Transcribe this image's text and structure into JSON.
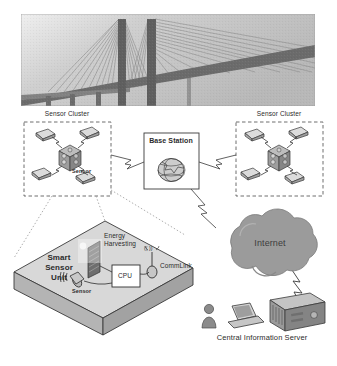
{
  "figure": {
    "type": "diagram",
    "background_color": "#ffffff",
    "ink_color": "#2b2b2b"
  },
  "photo": {
    "name": "cable-stayed-bridge-photo",
    "caption": "",
    "description": "Grayscale photograph of a cable-stayed bridge with two vertical pylons and fanned stay cables",
    "sky_color": "#c9c9c9",
    "structure_color": "#6f6f6f"
  },
  "clusters": [
    {
      "id": "left",
      "label": "Sensor Cluster",
      "node_count": 4,
      "node_label": "Sensor",
      "hub_label": ""
    },
    {
      "id": "right",
      "label": "Sensor Cluster",
      "node_count": 4,
      "node_label": "",
      "hub_label": ""
    }
  ],
  "base_station": {
    "label": "Base Station",
    "icon": "globe-icon"
  },
  "internet": {
    "label": "Internet",
    "fill": "#9b9b9b"
  },
  "server_group": {
    "label": "Central Information Server",
    "icons": [
      "user-icon",
      "laptop-icon",
      "server-icon"
    ]
  },
  "smart_sensor_unit": {
    "label": "Smart Sensor Unit",
    "label_lines": [
      "Smart",
      "Sensor",
      "Unit"
    ],
    "components": [
      {
        "name": "energy-harvesting",
        "label": "Energy Harvesting",
        "label_lines": [
          "Energy",
          "Harvesting"
        ],
        "icon": "solar-panel-icon"
      },
      {
        "name": "cpu",
        "label": "CPU",
        "icon": "cpu-box-icon"
      },
      {
        "name": "comm-link",
        "label": "CommLink",
        "icon": "antenna-icon",
        "signal_glyph": "(( ))"
      },
      {
        "name": "sensor",
        "label": "Sensor",
        "icon": "transducer-icon"
      }
    ],
    "face_fill": "#d8d8d8",
    "side_fill": "#b4b4b4"
  },
  "links": [
    {
      "from": "left-cluster",
      "to": "base-station",
      "style": "wireless-lightning"
    },
    {
      "from": "right-cluster",
      "to": "base-station",
      "style": "wireless-lightning"
    },
    {
      "from": "base-station",
      "to": "internet",
      "style": "wireless-lightning"
    },
    {
      "from": "internet",
      "to": "central-server",
      "style": "wireless-lightning"
    },
    {
      "from": "left-cluster",
      "to": "smart-sensor-unit",
      "style": "callout-dotted"
    }
  ]
}
